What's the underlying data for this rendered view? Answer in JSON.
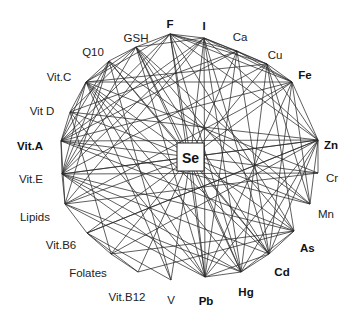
{
  "hub": {
    "id": "Se",
    "label": "Se",
    "x": 190.5,
    "y": 157,
    "w": 27,
    "h": 28
  },
  "nodes": [
    {
      "id": "F",
      "label": "F",
      "bold": true,
      "x": 170,
      "y": 34,
      "lx": 170,
      "ly": 24,
      "anchor": "middle"
    },
    {
      "id": "I",
      "label": "I",
      "bold": true,
      "x": 204,
      "y": 38,
      "lx": 204,
      "ly": 26,
      "anchor": "middle"
    },
    {
      "id": "Ca",
      "label": "Ca",
      "bold": false,
      "x": 237,
      "y": 51,
      "lx": 240,
      "ly": 37,
      "anchor": "middle"
    },
    {
      "id": "Cu",
      "label": "Cu",
      "bold": false,
      "x": 267,
      "y": 64,
      "lx": 275,
      "ly": 55,
      "anchor": "middle"
    },
    {
      "id": "Fe",
      "label": "Fe",
      "bold": true,
      "x": 292,
      "y": 82,
      "lx": 305,
      "ly": 75,
      "anchor": "middle"
    },
    {
      "id": "Zn",
      "label": "Zn",
      "bold": true,
      "x": 318,
      "y": 140,
      "lx": 324,
      "ly": 145,
      "anchor": "start"
    },
    {
      "id": "Cr",
      "label": "Cr",
      "bold": false,
      "x": 318,
      "y": 173,
      "lx": 326,
      "ly": 178,
      "anchor": "start"
    },
    {
      "id": "Mn",
      "label": "Mn",
      "bold": false,
      "x": 310,
      "y": 204,
      "lx": 318,
      "ly": 214,
      "anchor": "start"
    },
    {
      "id": "As",
      "label": "As",
      "bold": true,
      "x": 294,
      "y": 231,
      "lx": 300,
      "ly": 248,
      "anchor": "start"
    },
    {
      "id": "Cd",
      "label": "Cd",
      "bold": true,
      "x": 269,
      "y": 254,
      "lx": 282,
      "ly": 272,
      "anchor": "middle"
    },
    {
      "id": "Hg",
      "label": "Hg",
      "bold": true,
      "x": 241,
      "y": 272,
      "lx": 246,
      "ly": 292,
      "anchor": "middle"
    },
    {
      "id": "Pb",
      "label": "Pb",
      "bold": true,
      "x": 205,
      "y": 277,
      "lx": 206,
      "ly": 301,
      "anchor": "middle"
    },
    {
      "id": "V",
      "label": "V",
      "bold": false,
      "x": 171,
      "y": 280,
      "lx": 171,
      "ly": 300,
      "anchor": "middle"
    },
    {
      "id": "Vit.B12",
      "label": "Vit.B12",
      "bold": false,
      "x": 138,
      "y": 272,
      "lx": 127,
      "ly": 297,
      "anchor": "middle"
    },
    {
      "id": "Folates",
      "label": "Folates",
      "bold": false,
      "x": 111,
      "y": 254,
      "lx": 88,
      "ly": 273,
      "anchor": "middle"
    },
    {
      "id": "Vit.B6",
      "label": "Vit.B6",
      "bold": false,
      "x": 87,
      "y": 233,
      "lx": 61,
      "ly": 245,
      "anchor": "middle"
    },
    {
      "id": "Lipids",
      "label": "Lipids",
      "bold": false,
      "x": 65,
      "y": 204,
      "lx": 35,
      "ly": 217,
      "anchor": "middle"
    },
    {
      "id": "Vit.E",
      "label": "Vit.E",
      "bold": false,
      "x": 62,
      "y": 174,
      "lx": 31,
      "ly": 179,
      "anchor": "middle"
    },
    {
      "id": "Vit.A",
      "label": "Vit.A",
      "bold": true,
      "x": 61,
      "y": 141,
      "lx": 30,
      "ly": 146,
      "anchor": "middle"
    },
    {
      "id": "Vit D",
      "label": "Vit D",
      "bold": false,
      "x": 70,
      "y": 112,
      "lx": 42,
      "ly": 111,
      "anchor": "middle"
    },
    {
      "id": "Vit.C",
      "label": "Vit.C",
      "bold": false,
      "x": 86,
      "y": 82,
      "lx": 59,
      "ly": 77,
      "anchor": "middle"
    },
    {
      "id": "Q10",
      "label": "Q10",
      "bold": false,
      "x": 109,
      "y": 61,
      "lx": 93,
      "ly": 52,
      "anchor": "middle"
    },
    {
      "id": "GSH",
      "label": "GSH",
      "bold": false,
      "x": 136,
      "y": 47,
      "lx": 136,
      "ly": 38,
      "anchor": "middle"
    }
  ],
  "edges": [
    [
      "F",
      "I"
    ],
    [
      "F",
      "Ca"
    ],
    [
      "F",
      "Cu"
    ],
    [
      "F",
      "Fe"
    ],
    [
      "F",
      "Zn"
    ],
    [
      "F",
      "GSH"
    ],
    [
      "F",
      "Vit.A"
    ],
    [
      "F",
      "Pb"
    ],
    [
      "F",
      "Hg"
    ],
    [
      "F",
      "As"
    ],
    [
      "F",
      "Vit.C"
    ],
    [
      "F",
      "Vit.E"
    ],
    [
      "I",
      "Ca"
    ],
    [
      "I",
      "Cu"
    ],
    [
      "I",
      "Fe"
    ],
    [
      "I",
      "Zn"
    ],
    [
      "I",
      "GSH"
    ],
    [
      "I",
      "Vit.A"
    ],
    [
      "I",
      "Hg"
    ],
    [
      "I",
      "Cd"
    ],
    [
      "I",
      "Vit.E"
    ],
    [
      "I",
      "Lipids"
    ],
    [
      "I",
      "Pb"
    ],
    [
      "Ca",
      "Cu"
    ],
    [
      "Ca",
      "Fe"
    ],
    [
      "Ca",
      "Pb"
    ],
    [
      "Ca",
      "Vit D"
    ],
    [
      "Ca",
      "Cd"
    ],
    [
      "Ca",
      "Vit.A"
    ],
    [
      "Cu",
      "Fe"
    ],
    [
      "Cu",
      "Zn"
    ],
    [
      "Cu",
      "Hg"
    ],
    [
      "Cu",
      "Vit.C"
    ],
    [
      "Cu",
      "Vit.E"
    ],
    [
      "Cu",
      "Mn"
    ],
    [
      "Cu",
      "As"
    ],
    [
      "Fe",
      "Zn"
    ],
    [
      "Fe",
      "Cd"
    ],
    [
      "Fe",
      "Vit.C"
    ],
    [
      "Fe",
      "Vit.A"
    ],
    [
      "Fe",
      "Mn"
    ],
    [
      "Fe",
      "Pb"
    ],
    [
      "Fe",
      "Lipids"
    ],
    [
      "Zn",
      "Cr"
    ],
    [
      "Zn",
      "Vit.A"
    ],
    [
      "Zn",
      "Vit.E"
    ],
    [
      "Zn",
      "Cd"
    ],
    [
      "Zn",
      "Hg"
    ],
    [
      "Zn",
      "Pb"
    ],
    [
      "Zn",
      "Folates"
    ],
    [
      "Zn",
      "Vit.B6"
    ],
    [
      "Zn",
      "Mn"
    ],
    [
      "Cr",
      "Lipids"
    ],
    [
      "Cr",
      "Vit.E"
    ],
    [
      "Cr",
      "Vit.C"
    ],
    [
      "Mn",
      "Vit.A"
    ],
    [
      "Mn",
      "Q10"
    ],
    [
      "Mn",
      "GSH"
    ],
    [
      "As",
      "Vit.A"
    ],
    [
      "As",
      "Vit.E"
    ],
    [
      "As",
      "Folates"
    ],
    [
      "As",
      "Vit.B12"
    ],
    [
      "As",
      "GSH"
    ],
    [
      "As",
      "Cd"
    ],
    [
      "As",
      "Hg"
    ],
    [
      "Cd",
      "Hg"
    ],
    [
      "Cd",
      "Vit.C"
    ],
    [
      "Cd",
      "Vit.E"
    ],
    [
      "Cd",
      "GSH"
    ],
    [
      "Cd",
      "Q10"
    ],
    [
      "Cd",
      "Pb"
    ],
    [
      "Hg",
      "Pb"
    ],
    [
      "Hg",
      "Vit.E"
    ],
    [
      "Hg",
      "GSH"
    ],
    [
      "Hg",
      "Vit.C"
    ],
    [
      "Hg",
      "Lipids"
    ],
    [
      "Pb",
      "Vit.C"
    ],
    [
      "Pb",
      "Vit D"
    ],
    [
      "Pb",
      "Vit.E"
    ],
    [
      "Pb",
      "GSH"
    ],
    [
      "Pb",
      "Lipids"
    ],
    [
      "V",
      "Vit.B6"
    ],
    [
      "V",
      "Vit.C"
    ],
    [
      "V",
      "Q10"
    ],
    [
      "Vit.B12",
      "Folates"
    ],
    [
      "Vit.B12",
      "Vit.B6"
    ],
    [
      "Folates",
      "Vit.B6"
    ],
    [
      "Folates",
      "Vit D"
    ],
    [
      "Vit.B6",
      "Zn"
    ],
    [
      "Vit.B6",
      "Lipids"
    ],
    [
      "Lipids",
      "Vit.E"
    ],
    [
      "Lipids",
      "Vit.A"
    ],
    [
      "Lipids",
      "Q10"
    ],
    [
      "Vit.E",
      "Vit.A"
    ],
    [
      "Vit.E",
      "Vit.C"
    ],
    [
      "Vit.E",
      "Q10"
    ],
    [
      "Vit.E",
      "GSH"
    ],
    [
      "Vit.A",
      "Vit D"
    ],
    [
      "Vit.A",
      "Vit.C"
    ],
    [
      "Vit.A",
      "Q10"
    ],
    [
      "Vit D",
      "Vit.C"
    ],
    [
      "Vit D",
      "GSH"
    ],
    [
      "Vit D",
      "Zn"
    ],
    [
      "Vit.C",
      "Q10"
    ],
    [
      "Vit.C",
      "GSH"
    ],
    [
      "Q10",
      "GSH"
    ]
  ],
  "hub_edges": [
    "F",
    "I",
    "Ca",
    "Cu",
    "Fe",
    "Zn",
    "Cr",
    "Mn",
    "As",
    "Cd",
    "Hg",
    "Pb",
    "V",
    "Vit.B12",
    "Folates",
    "Vit.B6",
    "Lipids",
    "Vit.E",
    "Vit.A",
    "Vit D",
    "Vit.C",
    "Q10",
    "GSH"
  ]
}
